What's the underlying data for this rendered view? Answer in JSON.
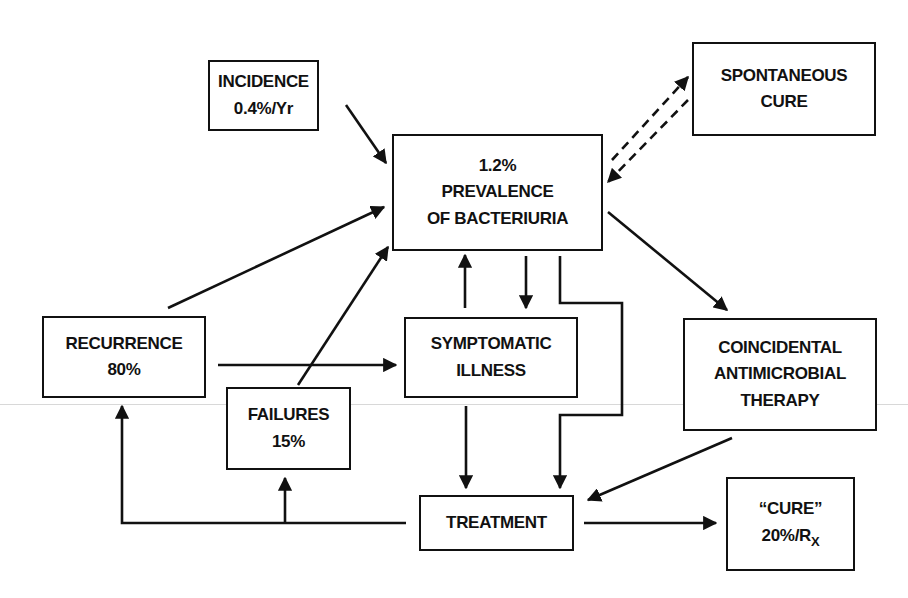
{
  "diagram": {
    "type": "flow-diagram",
    "nodes": {
      "incidence": {
        "line1": "INCIDENCE",
        "line2": "0.4%/Yr"
      },
      "prevalence": {
        "line1": "1.2%",
        "line2": "PREVALENCE",
        "line3": "OF BACTERIURIA"
      },
      "spontaneous_cure": {
        "line1": "SPONTANEOUS",
        "line2": "CURE"
      },
      "recurrence": {
        "line1": "RECURRENCE",
        "line2": "80%"
      },
      "symptomatic_illness": {
        "line1": "SYMPTOMATIC",
        "line2": "ILLNESS"
      },
      "coincidental_therapy": {
        "line1": "COINCIDENTAL",
        "line2": "ANTIMICROBIAL",
        "line3": "THERAPY"
      },
      "failures": {
        "line1": "FAILURES",
        "line2": "15%"
      },
      "treatment": {
        "line1": "TREATMENT"
      },
      "cure": {
        "line1": "“CURE”",
        "line2_main": "20%/R",
        "line2_sub": "X"
      }
    },
    "edges": [
      {
        "from": "incidence",
        "to": "prevalence",
        "style": "solid"
      },
      {
        "from": "spontaneous_cure",
        "to": "prevalence",
        "style": "dashed-bidirectional"
      },
      {
        "from": "recurrence",
        "to": "prevalence",
        "style": "solid"
      },
      {
        "from": "failures",
        "to": "prevalence",
        "style": "solid"
      },
      {
        "from": "symptomatic_illness",
        "to": "prevalence",
        "style": "solid"
      },
      {
        "from": "prevalence",
        "to": "symptomatic_illness",
        "style": "solid"
      },
      {
        "from": "prevalence",
        "to": "treatment",
        "style": "solid-elbow"
      },
      {
        "from": "prevalence",
        "to": "coincidental_therapy",
        "style": "solid"
      },
      {
        "from": "recurrence",
        "to": "symptomatic_illness",
        "style": "solid"
      },
      {
        "from": "symptomatic_illness",
        "to": "treatment",
        "style": "solid"
      },
      {
        "from": "coincidental_therapy",
        "to": "treatment",
        "style": "solid"
      },
      {
        "from": "treatment",
        "to": "recurrence",
        "style": "solid-elbow"
      },
      {
        "from": "treatment",
        "to": "failures",
        "style": "solid-elbow"
      },
      {
        "from": "treatment",
        "to": "cure",
        "style": "solid"
      }
    ],
    "colors": {
      "ink": "#111111",
      "background": "#ffffff"
    }
  }
}
